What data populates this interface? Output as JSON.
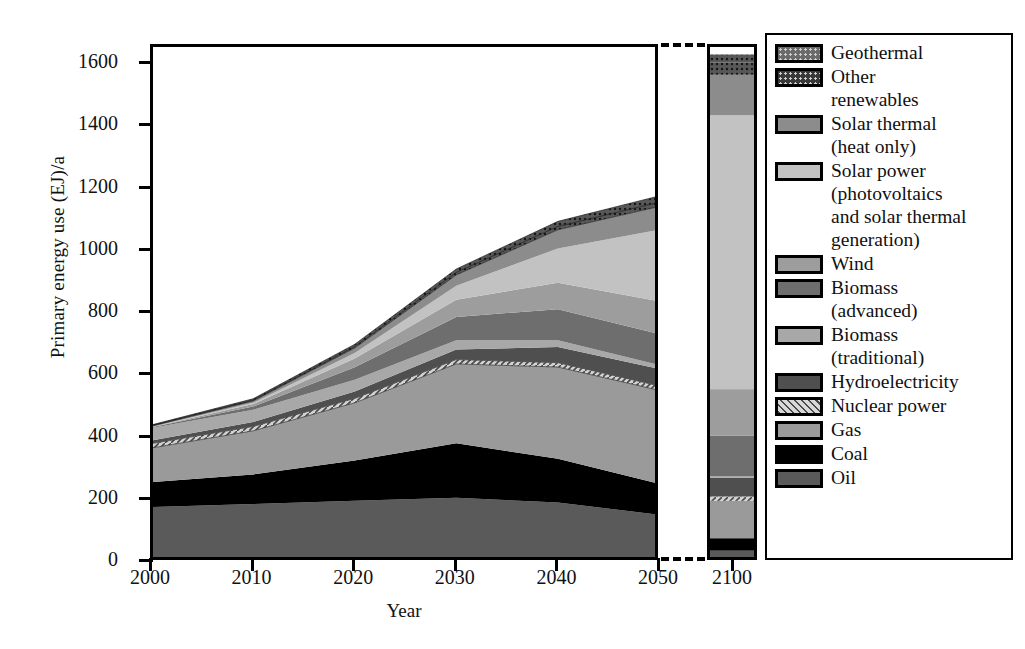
{
  "chart_data": {
    "type": "area",
    "title": "",
    "xlabel": "Year",
    "ylabel": "Primary energy use (EJ)/a",
    "ylim": [
      0,
      1700
    ],
    "yticks": [
      0,
      200,
      400,
      600,
      800,
      1000,
      1200,
      1400,
      1600
    ],
    "ytick_labels": [
      "0",
      "200",
      "400",
      "600",
      "800",
      "1000",
      "1200",
      "1400",
      "1600"
    ],
    "xticks": [
      2000,
      2010,
      2020,
      2030,
      2040,
      2050
    ],
    "xtick_labels": [
      "2000",
      "2010",
      "2020",
      "2030",
      "2040",
      "2050"
    ],
    "break_panel": {
      "xtick": 2100,
      "xtick_label": "2100",
      "note": "axis break between 2050 and 2100"
    },
    "grid": false,
    "legend_position": "right",
    "stack_order_bottom_to_top": [
      "Oil",
      "Coal",
      "Gas",
      "Nuclear power",
      "Hydroelectricity",
      "Biomass (traditional)",
      "Biomass (advanced)",
      "Wind",
      "Solar power (photovoltaics and solar thermal generation)",
      "Solar thermal (heat only)",
      "Other renewables",
      "Geothermal"
    ],
    "x": [
      2000,
      2010,
      2020,
      2030,
      2040,
      2050,
      2100
    ],
    "series": [
      {
        "name": "Oil",
        "color": "#5a5a5a",
        "pattern": "solid",
        "values": [
          170,
          180,
          190,
          200,
          185,
          145,
          30
        ]
      },
      {
        "name": "Coal",
        "color": "#000000",
        "pattern": "solid",
        "values": [
          80,
          95,
          130,
          175,
          140,
          100,
          40
        ]
      },
      {
        "name": "Gas",
        "color": "#9a9a9a",
        "pattern": "solid",
        "values": [
          110,
          140,
          185,
          255,
          295,
          300,
          120
        ]
      },
      {
        "name": "Nuclear power",
        "color": "#b5b5b5",
        "pattern": "hatch",
        "values": [
          14,
          14,
          14,
          14,
          14,
          14,
          14
        ]
      },
      {
        "name": "Hydroelectricity",
        "color": "#4f4f4f",
        "pattern": "solid",
        "values": [
          10,
          14,
          22,
          32,
          50,
          55,
          60
        ]
      },
      {
        "name": "Biomass (traditional)",
        "color": "#a8a8a8",
        "pattern": "solid",
        "values": [
          40,
          40,
          38,
          30,
          22,
          12,
          5
        ]
      },
      {
        "name": "Biomass (advanced)",
        "color": "#6e6e6e",
        "pattern": "solid",
        "values": [
          2,
          10,
          40,
          75,
          100,
          100,
          130
        ]
      },
      {
        "name": "Wind",
        "color": "#9d9d9d",
        "pattern": "solid",
        "values": [
          1,
          8,
          28,
          55,
          85,
          105,
          150
        ]
      },
      {
        "name": "Solar power (photovoltaics and solar thermal generation)",
        "color": "#c2c2c2",
        "pattern": "solid",
        "values": [
          1,
          4,
          18,
          45,
          110,
          230,
          880
        ]
      },
      {
        "name": "Solar thermal (heat only)",
        "color": "#8c8c8c",
        "pattern": "solid",
        "values": [
          2,
          6,
          16,
          35,
          60,
          75,
          130
        ]
      },
      {
        "name": "Other renewables",
        "color": "#383838",
        "pattern": "dots",
        "values": [
          2,
          3,
          5,
          8,
          11,
          14,
          40
        ]
      },
      {
        "name": "Geothermal",
        "color": "#6a6a6a",
        "pattern": "dots",
        "values": [
          2,
          4,
          7,
          11,
          16,
          20,
          25
        ]
      }
    ],
    "totals": [
      434,
      518,
      693,
      735,
      1088,
      1170,
      1624
    ]
  },
  "axis": {
    "y_title": "Primary energy use (EJ)/a",
    "x_title": "Year",
    "y_ticks": [
      "1600",
      "1400",
      "1200",
      "1000",
      "800",
      "600",
      "400",
      "200",
      "0"
    ],
    "x_ticks": [
      "2000",
      "2010",
      "2020",
      "2030",
      "2040",
      "2050"
    ],
    "x_tick_break": "2100"
  },
  "legend": {
    "items": [
      {
        "label_lines": [
          "Geothermal"
        ],
        "color": "#6a6a6a",
        "pattern": "dots"
      },
      {
        "label_lines": [
          "Other",
          "renewables"
        ],
        "color": "#383838",
        "pattern": "dots"
      },
      {
        "label_lines": [
          "Solar thermal",
          "(heat only)"
        ],
        "color": "#8c8c8c",
        "pattern": "solid"
      },
      {
        "label_lines": [
          "Solar power",
          "(photovoltaics",
          "and solar thermal",
          "generation)"
        ],
        "color": "#c2c2c2",
        "pattern": "solid"
      },
      {
        "label_lines": [
          "Wind"
        ],
        "color": "#9d9d9d",
        "pattern": "solid"
      },
      {
        "label_lines": [
          "Biomass",
          "(advanced)"
        ],
        "color": "#6e6e6e",
        "pattern": "solid"
      },
      {
        "label_lines": [
          "Biomass",
          "(traditional)"
        ],
        "color": "#a8a8a8",
        "pattern": "solid"
      },
      {
        "label_lines": [
          "Hydroelectricity"
        ],
        "color": "#4f4f4f",
        "pattern": "solid"
      },
      {
        "label_lines": [
          "Nuclear power"
        ],
        "color": "#b5b5b5",
        "pattern": "hatch"
      },
      {
        "label_lines": [
          "Gas"
        ],
        "color": "#9a9a9a",
        "pattern": "solid"
      },
      {
        "label_lines": [
          "Coal"
        ],
        "color": "#000000",
        "pattern": "solid"
      },
      {
        "label_lines": [
          "Oil"
        ],
        "color": "#5a5a5a",
        "pattern": "solid"
      }
    ]
  }
}
